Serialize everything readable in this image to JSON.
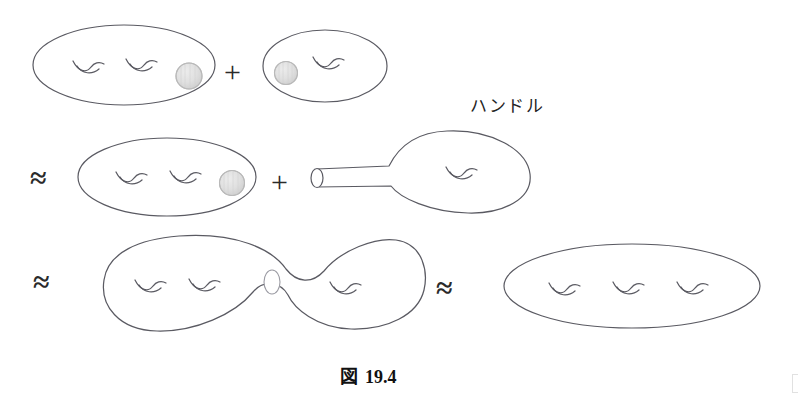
{
  "figure": {
    "caption_symbol": "図",
    "caption_number": "19.4",
    "caption_full": "図 19.4",
    "annotation_label": "ハンドル",
    "stroke_color": "#4a4a52",
    "disk_fill_color": "#dcdcdc",
    "disk_stroke_color": "#b4b4b4",
    "background_color": "#ffffff"
  },
  "operators": {
    "plus": "+",
    "approx": "≈"
  },
  "rows": [
    {
      "id": "row-1",
      "description": "genus-2 surface with marked disk plus genus-1 surface with marked disk",
      "items": [
        {
          "kind": "surface",
          "genus": 2,
          "marked_disk": "right"
        },
        {
          "kind": "operator",
          "symbol": "+"
        },
        {
          "kind": "surface",
          "genus": 1,
          "marked_disk": "left"
        }
      ]
    },
    {
      "id": "row-2",
      "description": "approx genus-2 surface with marked disk plus genus-1 surface with attached tube handle",
      "items": [
        {
          "kind": "operator",
          "symbol": "≈"
        },
        {
          "kind": "surface",
          "genus": 2,
          "marked_disk": "right"
        },
        {
          "kind": "operator",
          "symbol": "+"
        },
        {
          "kind": "surface",
          "genus": 1,
          "marked_disk": "none",
          "tube": "left",
          "annotation": "ハンドル"
        }
      ]
    },
    {
      "id": "row-3",
      "description": "approx dumbbell connected sum with neck circle, approx genus-3 surface",
      "items": [
        {
          "kind": "operator",
          "symbol": "≈"
        },
        {
          "kind": "surface",
          "genus": 3,
          "shape": "dumbbell",
          "neck": true
        },
        {
          "kind": "operator",
          "symbol": "≈"
        },
        {
          "kind": "surface",
          "genus": 3,
          "shape": "ellipse"
        }
      ]
    }
  ]
}
